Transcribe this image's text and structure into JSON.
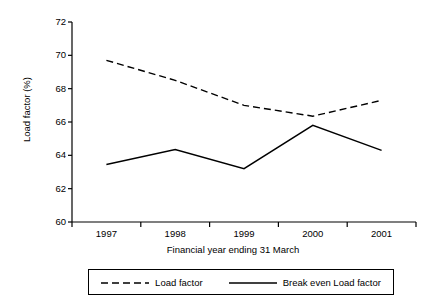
{
  "chart_data": {
    "type": "line",
    "title": "",
    "xlabel": "Financial year ending 31 March",
    "ylabel": "Load factor (%)",
    "categories": [
      "1997",
      "1998",
      "1999",
      "2000",
      "2001"
    ],
    "ylim": [
      60,
      72
    ],
    "yticks": [
      60,
      62,
      64,
      66,
      68,
      70,
      72
    ],
    "ytick_labels": [
      "60",
      "62",
      "64",
      "66",
      "68",
      "70",
      "72"
    ],
    "grid": false,
    "legend_position": "below-plot",
    "series": [
      {
        "name": "Load factor",
        "style": "dashed",
        "color": "#000000",
        "values": [
          69.7,
          68.5,
          67.0,
          66.35,
          67.3
        ]
      },
      {
        "name": "Break even Load factor",
        "style": "solid",
        "color": "#000000",
        "values": [
          63.45,
          64.35,
          63.2,
          65.8,
          64.3
        ]
      }
    ]
  },
  "legend": {
    "entries": [
      {
        "label": "Load factor"
      },
      {
        "label": "Break even Load factor"
      }
    ]
  },
  "colors": {
    "axis": "#000000",
    "background": "#ffffff",
    "series_line": "#000000"
  }
}
